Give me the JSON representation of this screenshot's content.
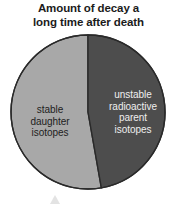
{
  "chart_data": {
    "type": "pie",
    "title": "Amount of decay a long time after death",
    "title_lines": [
      "Amount of decay a",
      "long time after death"
    ],
    "categories": [
      "stable daughter isotopes",
      "unstable radioactive parent isotopes"
    ],
    "values": [
      53,
      47
    ],
    "units": "percent",
    "legend": "none",
    "grid": false,
    "xlabel": "",
    "ylabel": "",
    "slices": [
      {
        "name": "stable-daughter-isotopes",
        "label_lines": [
          "stable",
          "daughter",
          "isotopes"
        ],
        "value": 53,
        "color": "#a8a8a8",
        "text_color": "#1d1d1d",
        "start_angle_deg": 170,
        "end_angle_deg": 360
      },
      {
        "name": "unstable-radioactive-parent-isotopes",
        "label_lines": [
          "unstable",
          "radioactive",
          "parent",
          "isotopes"
        ],
        "value": 47,
        "color": "#4d4d4d",
        "text_color": "#efefef",
        "start_angle_deg": 0,
        "end_angle_deg": 170
      }
    ],
    "geometry": {
      "center_x": 88,
      "center_y": 112,
      "radius": 77
    },
    "outline_color": "#2a2a2a",
    "background": "#ffffff"
  },
  "labels": {
    "stable_line1": "stable",
    "stable_line2": "daughter",
    "stable_line3": "isotopes",
    "unstable_line1": "unstable",
    "unstable_line2": "radioactive",
    "unstable_line3": "parent",
    "unstable_line4": "isotopes"
  },
  "title": {
    "line1": "Amount of decay a",
    "line2": "long time after death"
  }
}
